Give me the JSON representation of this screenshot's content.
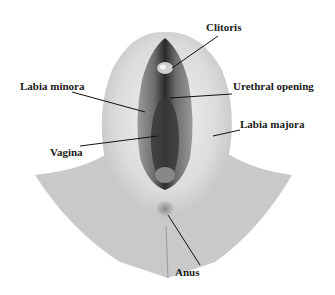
{
  "diagram": {
    "labels": {
      "clitoris": "Clitoris",
      "labia_minora": "Labia minora",
      "urethral_opening": "Urethral opening",
      "labia_majora": "Labia majora",
      "vagina": "Vagina",
      "anus": "Anus"
    }
  }
}
